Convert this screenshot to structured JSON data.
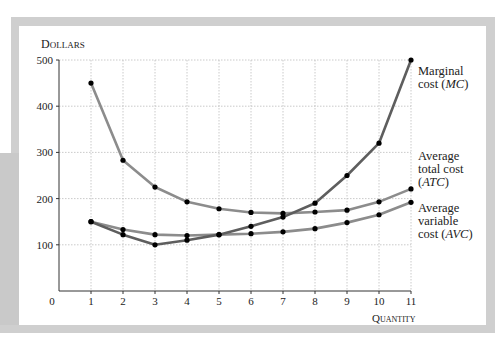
{
  "chart_data": {
    "type": "line",
    "title": "",
    "xlabel": "Quantity",
    "ylabel": "Dollars",
    "x": [
      1,
      2,
      3,
      4,
      5,
      6,
      7,
      8,
      9,
      10,
      11
    ],
    "xticks": [
      "0",
      "1",
      "2",
      "3",
      "4",
      "5",
      "6",
      "7",
      "8",
      "9",
      "10",
      "11"
    ],
    "yticks": [
      "100",
      "200",
      "300",
      "400",
      "500"
    ],
    "ylim": [
      0,
      500
    ],
    "xlim": [
      0,
      11
    ],
    "grid": true,
    "legend_position": "right, inline labels at curve ends",
    "series": [
      {
        "name": "Marginal cost (MC)",
        "label_lines": [
          "Marginal",
          "cost (",
          "MC",
          ")"
        ],
        "color": "#5e5e5e",
        "values": [
          150,
          122,
          100,
          110,
          122,
          140,
          160,
          190,
          250,
          320,
          500
        ]
      },
      {
        "name": "Average total cost (ATC)",
        "label_lines": [
          "Average",
          "total cost",
          "(",
          "ATC",
          ")"
        ],
        "color": "#8c8c8c",
        "values": [
          450,
          283,
          225,
          193,
          178,
          170,
          168,
          171,
          175,
          193,
          221
        ]
      },
      {
        "name": "Average variable cost (AVC)",
        "label_lines": [
          "Average",
          "variable",
          "cost (",
          "AVC",
          ")"
        ],
        "color": "#8c8c8c",
        "values": [
          150,
          133,
          122,
          120,
          122,
          124,
          128,
          135,
          148,
          165,
          192
        ]
      }
    ]
  },
  "labels": {
    "ylabel": "Dollars",
    "xlabel": "Quantity",
    "mc": {
      "line1": "Marginal",
      "line2a": "cost (",
      "line2b": "MC",
      "line2c": ")"
    },
    "atc": {
      "line1": "Average",
      "line2": "total cost",
      "line3a": "(",
      "line3b": "ATC",
      "line3c": ")"
    },
    "avc": {
      "line1": "Average",
      "line2": "variable",
      "line3a": "cost (",
      "line3b": "AVC",
      "line3c": ")"
    }
  }
}
